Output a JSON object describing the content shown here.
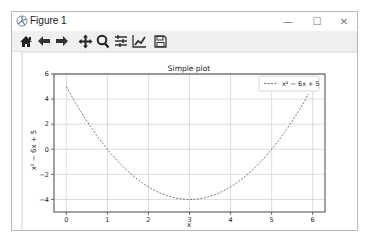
{
  "window": {
    "title": "Figure 1",
    "controls": {
      "minimize": "—",
      "maximize": "☐",
      "close": "✕"
    }
  },
  "toolbar": {
    "buttons": [
      {
        "name": "home",
        "icon": "home-icon"
      },
      {
        "name": "back",
        "icon": "arrow-left-icon"
      },
      {
        "name": "forward",
        "icon": "arrow-right-icon"
      },
      {
        "name": "pan",
        "icon": "move-icon"
      },
      {
        "name": "zoom",
        "icon": "magnifier-icon"
      },
      {
        "name": "subplots",
        "icon": "sliders-icon"
      },
      {
        "name": "edit-axis",
        "icon": "line-chart-icon"
      },
      {
        "name": "save",
        "icon": "floppy-disk-icon"
      }
    ]
  },
  "chart_data": {
    "type": "line",
    "title": "Simple plot",
    "xlabel": "x",
    "ylabel": "x² − 6x + 5",
    "xlim": [
      -0.3,
      6.3
    ],
    "ylim": [
      -5,
      6
    ],
    "xticks": [
      0,
      1,
      2,
      3,
      4,
      5,
      6
    ],
    "yticks": [
      -4,
      -2,
      0,
      2,
      4,
      6
    ],
    "grid": true,
    "legend_position": "upper right",
    "series": [
      {
        "name": "x² − 6x + 5",
        "style": "dashed",
        "color": "#555555",
        "function": "x^2 - 6x + 5",
        "x": [
          0,
          0.5,
          1,
          1.5,
          2,
          2.5,
          3,
          3.5,
          4,
          4.5,
          5,
          5.5,
          5.9
        ],
        "values": [
          5,
          2.25,
          0,
          -1.75,
          -3,
          -3.75,
          -4,
          -3.75,
          -3,
          -1.75,
          0,
          2.25,
          4.41
        ]
      }
    ]
  }
}
